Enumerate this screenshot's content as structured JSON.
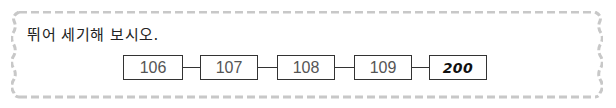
{
  "question": {
    "instruction": "뛰어 세기해 보시오."
  },
  "sequence": {
    "items": [
      {
        "value": "106",
        "type": "given"
      },
      {
        "value": "107",
        "type": "given"
      },
      {
        "value": "108",
        "type": "given"
      },
      {
        "value": "109",
        "type": "given"
      },
      {
        "value": "200",
        "type": "answer"
      }
    ]
  },
  "colors": {
    "frame": "#c8c8c8",
    "box_border": "#333333",
    "given_text": "#555555",
    "answer_text": "#111111"
  }
}
